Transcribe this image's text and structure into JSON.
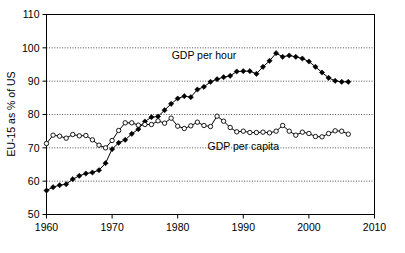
{
  "chart_data": {
    "type": "line",
    "title": "",
    "xlabel": "",
    "ylabel": "EU-15 as % of US",
    "xlim": [
      1960,
      2010
    ],
    "ylim": [
      50,
      110
    ],
    "xticks": [
      1960,
      1970,
      1980,
      1990,
      2000,
      2010
    ],
    "yticks": [
      50,
      60,
      70,
      80,
      90,
      100,
      110
    ],
    "grid": true,
    "grid_axis": "y",
    "legend_position": "inline-annotations",
    "annotations": [
      {
        "text": "GDP per hour",
        "x": 1984,
        "y": 96.6
      },
      {
        "text": "GDP per capita",
        "x": 1990,
        "y": 69.5
      }
    ],
    "x": [
      1960,
      1961,
      1962,
      1963,
      1964,
      1965,
      1966,
      1967,
      1968,
      1969,
      1970,
      1971,
      1972,
      1973,
      1974,
      1975,
      1976,
      1977,
      1978,
      1979,
      1980,
      1981,
      1982,
      1983,
      1984,
      1985,
      1986,
      1987,
      1988,
      1989,
      1990,
      1991,
      1992,
      1993,
      1994,
      1995,
      1996,
      1997,
      1998,
      1999,
      2000,
      2001,
      2002,
      2003,
      2004,
      2005,
      2006
    ],
    "series": [
      {
        "name": "GDP per hour",
        "marker": "filled-diamond",
        "values": [
          57.2,
          58.2,
          58.8,
          59.1,
          60.6,
          61.6,
          62.3,
          62.6,
          63.3,
          65.4,
          69.6,
          71.5,
          72.4,
          74.2,
          75.6,
          77.9,
          79.2,
          79.4,
          81.3,
          83.2,
          84.8,
          85.5,
          85.2,
          87.5,
          88.3,
          89.8,
          90.6,
          91.2,
          91.6,
          92.9,
          93.0,
          93.0,
          92.2,
          94.3,
          96.1,
          98.4,
          97.3,
          97.7,
          97.3,
          96.8,
          95.9,
          94.3,
          92.6,
          91.0,
          90.1,
          89.8,
          89.8
        ]
      },
      {
        "name": "GDP per capita",
        "marker": "hollow-circle",
        "values": [
          71.3,
          73.8,
          73.5,
          72.9,
          74.0,
          73.6,
          73.7,
          72.4,
          70.8,
          70.0,
          72.2,
          75.2,
          77.5,
          77.5,
          76.8,
          77.0,
          77.0,
          78.1,
          77.4,
          78.9,
          76.5,
          75.8,
          76.6,
          77.7,
          76.7,
          76.4,
          79.5,
          78.0,
          76.1,
          74.8,
          75.0,
          74.6,
          74.6,
          74.7,
          74.5,
          75.0,
          76.7,
          75.0,
          73.8,
          74.7,
          74.3,
          73.4,
          73.3,
          74.3,
          75.1,
          75.0,
          74.1
        ],
        "partial_note": "series spans 1960-2006"
      }
    ]
  },
  "axis": {
    "y_title": "EU-15 as % of US",
    "y_tick_labels": [
      "50",
      "60",
      "70",
      "80",
      "90",
      "100",
      "110"
    ],
    "x_tick_labels": [
      "1960",
      "1970",
      "1980",
      "1990",
      "2000",
      "2010"
    ]
  },
  "labels": {
    "series_hour": "GDP per hour",
    "series_capita": "GDP per capita"
  },
  "colors": {
    "background": "#ffffff",
    "foreground": "#000000",
    "grid": "#000000"
  }
}
